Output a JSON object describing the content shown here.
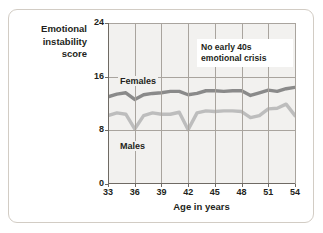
{
  "figure": {
    "y_axis_title_lines": [
      "Emotional",
      "instability",
      "score"
    ],
    "x_axis_title": "Age in years",
    "annotation_lines": [
      "No early 40s",
      "emotional crisis"
    ],
    "series_labels": {
      "females": "Females",
      "males": "Males"
    },
    "colors": {
      "card_border": "#d2ccc4",
      "plot_background": "#f2f1ef",
      "gridline": "#a9a49e",
      "axis": "#6f6a64",
      "females_line": "#8a8a8a",
      "males_line": "#bdbdbd",
      "text": "#231f20"
    }
  },
  "chart_data": {
    "type": "line",
    "title": "",
    "subtitle": "",
    "xlabel": "Age in years",
    "ylabel": "Emotional instability score",
    "xlim": [
      33,
      54
    ],
    "ylim": [
      0,
      24
    ],
    "yticks": [
      0,
      8,
      16,
      24
    ],
    "ytick_labels": [
      "0",
      "8",
      "16",
      "24"
    ],
    "xticks": [
      33,
      36,
      39,
      42,
      45,
      48,
      51,
      54
    ],
    "xtick_labels": [
      "33",
      "36",
      "39",
      "42",
      "45",
      "48",
      "51",
      "54"
    ],
    "grid": true,
    "legend": "inline-labels",
    "annotations": [
      {
        "text": "No early 40s emotional crisis",
        "x": 46.5,
        "y": 21
      }
    ],
    "x": [
      33,
      34,
      35,
      36,
      37,
      38,
      39,
      40,
      41,
      42,
      43,
      44,
      45,
      46,
      47,
      48,
      49,
      50,
      51,
      52,
      53,
      54
    ],
    "series": [
      {
        "name": "Females",
        "color": "#8a8a8a",
        "values": [
          13.0,
          13.4,
          13.6,
          12.6,
          13.3,
          13.5,
          13.6,
          13.8,
          13.8,
          13.3,
          13.5,
          13.9,
          13.9,
          13.8,
          13.9,
          13.9,
          13.2,
          13.6,
          14.0,
          13.8,
          14.2,
          14.4
        ]
      },
      {
        "name": "Males",
        "color": "#bdbdbd",
        "values": [
          10.2,
          10.6,
          10.4,
          8.2,
          10.2,
          10.6,
          10.4,
          10.4,
          10.7,
          8.1,
          10.6,
          10.9,
          10.8,
          10.9,
          10.9,
          10.8,
          9.9,
          10.2,
          11.2,
          11.3,
          11.9,
          10.2
        ]
      }
    ]
  }
}
